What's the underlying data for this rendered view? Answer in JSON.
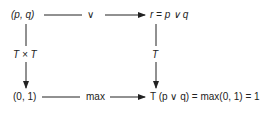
{
  "diagram": {
    "nodes": {
      "top_left": "(p, q)",
      "top_right": "r = p ∨ q",
      "bottom_left": "(0, 1)",
      "bottom_right": "T (p ∨ q) = max(0, 1) = 1"
    },
    "edges": {
      "top": "∨",
      "bottom": "max",
      "left": "T × T",
      "right": "T"
    }
  }
}
